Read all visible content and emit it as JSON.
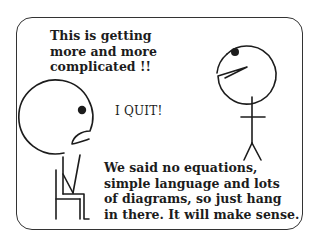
{
  "comic": {
    "top_caption": [
      "This is getting",
      "more and more",
      "complicated !!"
    ],
    "quit_text": "I QUIT!",
    "bottom_caption": [
      "We said no equations,",
      "simple language and lots",
      "of diagrams, so just hang",
      "in there. It will make sense."
    ],
    "figures": [
      {
        "name": "seated-frustrated-figure",
        "position": "left",
        "pose": "sitting on chair"
      },
      {
        "name": "standing-talking-figure",
        "position": "right",
        "pose": "standing, mouth open"
      }
    ],
    "colors": {
      "line": "#1c1c1c",
      "frame": "#333333",
      "background": "#ffffff"
    }
  }
}
